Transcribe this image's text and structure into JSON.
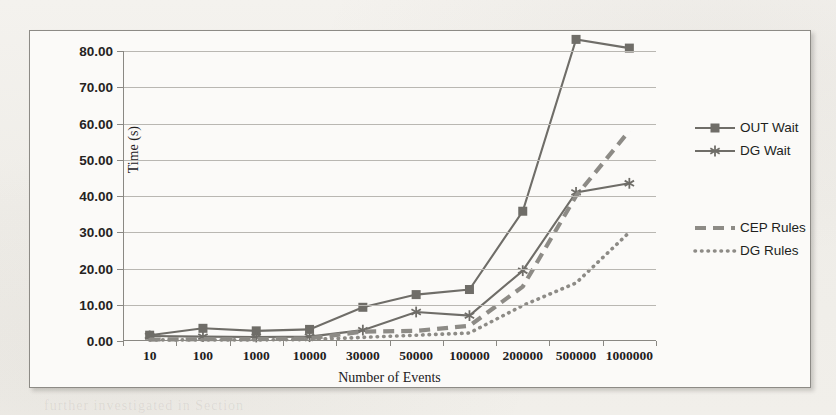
{
  "figure": {
    "xaxis_title": "Number of Events",
    "yaxis_title": "Time (s)"
  },
  "legend": {
    "entries": [
      {
        "label": "OUT Wait",
        "style": "solid-square",
        "color": "#6f6d68"
      },
      {
        "label": "DG Wait",
        "style": "solid-star",
        "color": "#6f6d68"
      },
      {
        "label": "CEP Rules",
        "style": "dashed",
        "color": "#8d8b86"
      },
      {
        "label": "DG Rules",
        "style": "dotted",
        "color": "#8d8b86"
      }
    ]
  },
  "chart_data": {
    "type": "line",
    "title": "",
    "xlabel": "Number of Events",
    "ylabel": "Time (s)",
    "categories": [
      "10",
      "100",
      "1000",
      "10000",
      "30000",
      "50000",
      "100000",
      "200000",
      "500000",
      "1000000"
    ],
    "ylim": [
      0,
      80
    ],
    "ytick_labels": [
      "0.00",
      "10.00",
      "20.00",
      "30.00",
      "40.00",
      "50.00",
      "60.00",
      "70.00",
      "80.00"
    ],
    "ytick_values": [
      0,
      10,
      20,
      30,
      40,
      50,
      60,
      70,
      80
    ],
    "grid": true,
    "legend_position": "right",
    "series": [
      {
        "name": "OUT Wait",
        "marker": "square",
        "line": "solid",
        "color": "#6f6d68",
        "values": [
          1.6,
          3.5,
          2.8,
          3.2,
          9.3,
          12.8,
          14.2,
          35.8,
          83.2,
          80.8
        ]
      },
      {
        "name": "DG Wait",
        "marker": "star",
        "line": "solid",
        "color": "#6f6d68",
        "values": [
          1.4,
          1.2,
          1.1,
          1.2,
          3.0,
          8.0,
          7.0,
          19.4,
          41.0,
          43.5
        ]
      },
      {
        "name": "CEP Rules",
        "marker": "none",
        "line": "dashed",
        "color": "#8d8b86",
        "values": [
          0.4,
          0.5,
          0.5,
          0.7,
          2.6,
          2.8,
          4.2,
          15.0,
          40.0,
          58.0
        ]
      },
      {
        "name": "DG Rules",
        "marker": "none",
        "line": "dotted",
        "color": "#8d8b86",
        "values": [
          0.3,
          0.3,
          0.3,
          0.4,
          1.0,
          1.6,
          2.2,
          9.8,
          16.0,
          30.0
        ]
      }
    ]
  },
  "background_ghost_text": {
    "lines": [
      {
        "text": "of the extended  simulation  runs",
        "x": 108,
        "y": 96
      },
      {
        "text": "in  Figure  12  the  measured  CEP",
        "x": 150,
        "y": 152
      },
      {
        "text": "and  the  DG  Rules  execution",
        "x": 122,
        "y": 196
      },
      {
        "text": "Table  XI :  Results  of  scalability",
        "x": 98,
        "y": 236
      },
      {
        "text": "a  the  throughput  of  the  system",
        "x": 30,
        "y": 300
      },
      {
        "text": "further  investigated  in  Section",
        "x": 44,
        "y": 398
      }
    ]
  }
}
